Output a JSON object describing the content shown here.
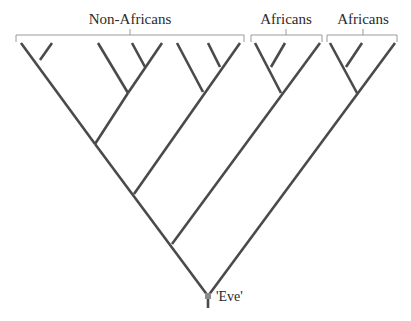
{
  "diagram": {
    "type": "phylogenetic-tree",
    "colors": {
      "branch": "#4a4a4a",
      "bracket": "#9a9a9a",
      "root_node": "#8a8a8a",
      "text": "#2a2a2a",
      "background": "#ffffff"
    },
    "groups": [
      {
        "label": "Non-Africans",
        "bracket": [
          16,
          244
        ],
        "tick_x": 130,
        "label_x": 130,
        "label_y": 12
      },
      {
        "label": "Africans",
        "bracket": [
          251,
          322
        ],
        "tick_x": 286,
        "label_x": 286,
        "label_y": 12
      },
      {
        "label": "Africans",
        "bracket": [
          327,
          397
        ],
        "tick_x": 363,
        "label_x": 363,
        "label_y": 12
      }
    ],
    "root": {
      "label": "'Eve'",
      "x": 208,
      "y": 296,
      "label_x": 216,
      "label_y": 290
    },
    "leaves": [
      {
        "x": 21,
        "y": 43
      },
      {
        "x": 52,
        "y": 43
      },
      {
        "x": 98,
        "y": 43
      },
      {
        "x": 132,
        "y": 43
      },
      {
        "x": 162,
        "y": 43
      },
      {
        "x": 177,
        "y": 43
      },
      {
        "x": 208,
        "y": 43
      },
      {
        "x": 240,
        "y": 43
      },
      {
        "x": 255,
        "y": 43
      },
      {
        "x": 285,
        "y": 43
      },
      {
        "x": 320,
        "y": 43
      },
      {
        "x": 330,
        "y": 43
      },
      {
        "x": 362,
        "y": 43
      },
      {
        "x": 395,
        "y": 43
      }
    ],
    "branches": [
      [
        21,
        43,
        95,
        144
      ],
      [
        52,
        43,
        40,
        60
      ],
      [
        98,
        43,
        128,
        93
      ],
      [
        132,
        43,
        145,
        67
      ],
      [
        162,
        43,
        128,
        93
      ],
      [
        128,
        93,
        95,
        144
      ],
      [
        177,
        43,
        203,
        92
      ],
      [
        208,
        43,
        220,
        67
      ],
      [
        240,
        43,
        134,
        194
      ],
      [
        95,
        144,
        208,
        296
      ],
      [
        255,
        43,
        281,
        93
      ],
      [
        285,
        43,
        271,
        67
      ],
      [
        320,
        43,
        172,
        244
      ],
      [
        330,
        43,
        357,
        93
      ],
      [
        362,
        43,
        346,
        67
      ],
      [
        395,
        43,
        208,
        296
      ],
      [
        208,
        296,
        208,
        308
      ]
    ]
  }
}
